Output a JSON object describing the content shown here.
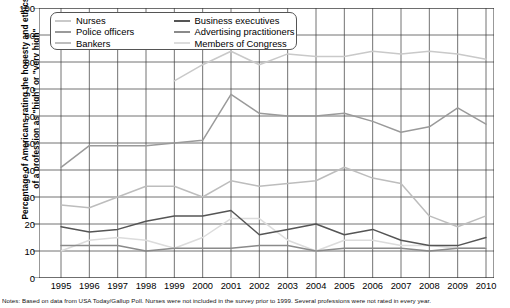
{
  "axis": {
    "ylabel_line1": "Percentage of Americans rating the honesty and ethics",
    "ylabel_line2": "of a profession as \"high\" or \"very high\"",
    "yticks": [
      "0",
      "10",
      "20",
      "30",
      "40",
      "50",
      "60",
      "70",
      "80",
      "90",
      "100"
    ],
    "xticks": [
      "1995",
      "1996",
      "1997",
      "1998",
      "1999",
      "2000",
      "2001",
      "2002",
      "2003",
      "2004",
      "2005",
      "2006",
      "2007",
      "2008",
      "2009",
      "2010"
    ]
  },
  "legend": {
    "items": [
      {
        "label": "Nurses",
        "color": "#c9c9c9"
      },
      {
        "label": "Business executives",
        "color": "#555555"
      },
      {
        "label": "Police officers",
        "color": "#9a9a9a"
      },
      {
        "label": "Advertising practitioners",
        "color": "#8a8a8a"
      },
      {
        "label": "Bankers",
        "color": "#bdbdbd"
      },
      {
        "label": "Members of Congress",
        "color": "#dcdcdc"
      }
    ]
  },
  "note": {
    "text": "Notes: Based on data from USA Today/Gallup Poll. Nurses were not included in the survey prior to 1999. Several professions were not rated in every year."
  },
  "chart_data": {
    "type": "line",
    "title": "",
    "xlabel": "",
    "ylabel": "Percentage of Americans rating the honesty and ethics of a profession as \"high\" or \"very high\"",
    "x": [
      1995,
      1996,
      1997,
      1998,
      1999,
      2000,
      2001,
      2002,
      2003,
      2004,
      2005,
      2006,
      2007,
      2008,
      2009,
      2010
    ],
    "ylim": [
      0,
      100
    ],
    "xlim": [
      1995,
      2010
    ],
    "grid": true,
    "legend_position": "top-left",
    "series": [
      {
        "name": "Nurses",
        "color": "#c9c9c9",
        "values": [
          null,
          null,
          null,
          null,
          73,
          79,
          84,
          79,
          83,
          82,
          82,
          84,
          83,
          84,
          83,
          81
        ]
      },
      {
        "name": "Police officers",
        "color": "#9a9a9a",
        "values": [
          41,
          49,
          49,
          49,
          50,
          51,
          68,
          61,
          60,
          60,
          61,
          58,
          54,
          56,
          63,
          57
        ]
      },
      {
        "name": "Bankers",
        "color": "#bdbdbd",
        "values": [
          27,
          26,
          30,
          34,
          34,
          30,
          36,
          34,
          35,
          36,
          41,
          37,
          35,
          23,
          19,
          23
        ]
      },
      {
        "name": "Business executives",
        "color": "#555555",
        "values": [
          19,
          17,
          18,
          21,
          23,
          23,
          25,
          16,
          18,
          20,
          16,
          18,
          14,
          12,
          12,
          15
        ]
      },
      {
        "name": "Advertising practitioners",
        "color": "#8a8a8a",
        "values": [
          12,
          12,
          12,
          10,
          11,
          11,
          11,
          12,
          12,
          10,
          11,
          11,
          11,
          10,
          11,
          11
        ]
      },
      {
        "name": "Members of Congress",
        "color": "#dcdcdc",
        "values": [
          10,
          14,
          15,
          14,
          11,
          15,
          22,
          22,
          14,
          10,
          14,
          14,
          12,
          12,
          11,
          11
        ]
      }
    ]
  }
}
